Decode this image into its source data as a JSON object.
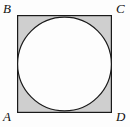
{
  "figure": {
    "caption": "",
    "shapes": {
      "square": {
        "name": "square ABCD",
        "fill_color": "#cfcfcf",
        "stroke_color": "#1a1a1a",
        "stroke_width": 1.2,
        "x": 17,
        "y": 15,
        "width": 95,
        "height": 98
      },
      "circle": {
        "name": "inscribed circle",
        "fill_color": "#fdfdfd",
        "stroke_color": "#1a1a1a",
        "stroke_width": 1.2,
        "center_x": 64.5,
        "center_y": 64,
        "radius": 47.5,
        "relationship": "inscribed in square, tangent to all four sides"
      }
    },
    "vertices": [
      {
        "id": "B",
        "label": "B",
        "position": "top-left"
      },
      {
        "id": "C",
        "label": "C",
        "position": "top-right"
      },
      {
        "id": "A",
        "label": "A",
        "position": "bottom-left"
      },
      {
        "id": "D",
        "label": "D",
        "position": "bottom-right"
      }
    ],
    "background_color": "#fdfdfd"
  }
}
